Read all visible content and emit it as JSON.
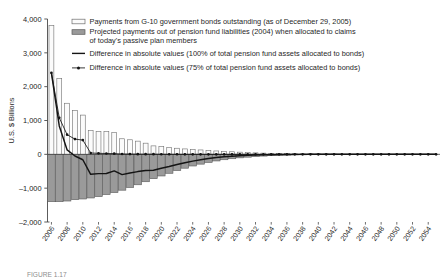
{
  "chart_data": {
    "type": "bar",
    "title": "",
    "subtitle": "",
    "xlabel": "",
    "ylabel": "U.S. $ Billions",
    "ylim": [
      -2000,
      4000
    ],
    "yticks": [
      4000,
      3000,
      2000,
      1000,
      0,
      -1000,
      -2000
    ],
    "ytick_labels": [
      "4,000",
      "3,000",
      "2,000",
      "1,000",
      "0",
      "–1,000",
      "–2,000"
    ],
    "grid": false,
    "legend_position": "upper-right-inside",
    "x": [
      2006,
      2007,
      2008,
      2009,
      2010,
      2011,
      2012,
      2013,
      2014,
      2015,
      2016,
      2017,
      2018,
      2019,
      2020,
      2021,
      2022,
      2023,
      2024,
      2025,
      2026,
      2027,
      2028,
      2029,
      2030,
      2031,
      2032,
      2033,
      2034,
      2035,
      2036,
      2037,
      2038,
      2039,
      2040,
      2041,
      2042,
      2043,
      2044,
      2045,
      2046,
      2047,
      2048,
      2049,
      2050,
      2051,
      2052,
      2053,
      2054,
      2055
    ],
    "xtick_labels": [
      "2006",
      "2008",
      "2010",
      "2012",
      "2014",
      "2016",
      "2018",
      "2020",
      "2022",
      "2024",
      "2026",
      "2028",
      "2030",
      "2032",
      "2034",
      "2036",
      "2038",
      "2040",
      "2042",
      "2044",
      "2046",
      "2048",
      "2050",
      "2052",
      "2054"
    ],
    "series": [
      {
        "name": "Payments from G-10 government bonds outstanding (as of December 29, 2005)",
        "key": "bonds_outstanding",
        "style": "bar-white",
        "values": [
          3810,
          2240,
          1510,
          1290,
          1160,
          700,
          680,
          670,
          640,
          460,
          430,
          390,
          330,
          250,
          230,
          200,
          180,
          160,
          145,
          130,
          115,
          100,
          88,
          76,
          64,
          54,
          44,
          36,
          30,
          25,
          20,
          17,
          14,
          12,
          10,
          9,
          8,
          7,
          6,
          5,
          5,
          4,
          4,
          3,
          3,
          3,
          2,
          2,
          2,
          2
        ]
      },
      {
        "name": "Projected payments out of pension fund liabilities (2004) when allocated to claims of today's passive plan members",
        "key": "pension_liabilities",
        "style": "bar-gray",
        "values": [
          -1400,
          -1400,
          -1380,
          -1340,
          -1320,
          -1290,
          -1250,
          -1190,
          -1130,
          -1060,
          -980,
          -900,
          -810,
          -720,
          -640,
          -560,
          -480,
          -410,
          -345,
          -290,
          -240,
          -196,
          -160,
          -130,
          -104,
          -84,
          -66,
          -52,
          -40,
          -31,
          -24,
          -19,
          -15,
          -12,
          -10,
          -8,
          -7,
          -6,
          -5,
          -4,
          -4,
          -3,
          -3,
          -2,
          -2,
          -2,
          -2,
          -1,
          -1,
          -1
        ]
      },
      {
        "name": "Difference in absolute values (100% of total pension fund assets allocated to bonds)",
        "key": "difference_100pct",
        "style": "line-solid",
        "values": [
          2410,
          840,
          130,
          -50,
          -160,
          -590,
          -570,
          -565,
          -490,
          -600,
          -550,
          -510,
          -480,
          -470,
          -410,
          -360,
          -300,
          -250,
          -200,
          -160,
          -125,
          -96,
          -72,
          -54,
          -40,
          -30,
          -22,
          -16,
          -10,
          -6,
          -4,
          -2,
          -1,
          0,
          0,
          0,
          0,
          0,
          0,
          0,
          0,
          0,
          0,
          0,
          0,
          0,
          0,
          0,
          0,
          0
        ]
      },
      {
        "name": "Difference in absolute values (75% of total pension fund assets allocated to bonds)",
        "key": "difference_75pct",
        "style": "line-marker",
        "values": [
          2410,
          1080,
          580,
          450,
          420,
          40,
          30,
          25,
          20,
          10,
          8,
          6,
          5,
          4,
          3,
          2,
          2,
          1,
          1,
          1,
          0,
          0,
          0,
          0,
          0,
          0,
          0,
          0,
          0,
          0,
          0,
          0,
          0,
          0,
          0,
          0,
          0,
          0,
          0,
          0,
          0,
          0,
          0,
          0,
          0,
          0,
          0,
          0,
          0,
          0
        ]
      }
    ]
  },
  "legend": {
    "items": [
      {
        "swatch": "bar-white",
        "label": "Payments from G-10 government bonds outstanding (as of December 29, 2005)"
      },
      {
        "swatch": "bar-gray",
        "label": "Projected payments out of pension fund liabilities (2004) when allocated to claims"
      },
      {
        "swatch": "none",
        "label": "of today's passive plan members"
      },
      {
        "swatch": "line-solid",
        "label": "Difference in absolute values (100% of total pension fund assets allocated to bonds)"
      },
      {
        "swatch": "line-marker",
        "label": "Difference in absolute values (75% of total pension fund assets allocated to bonds)"
      }
    ]
  },
  "colors": {
    "bar_white_fill": "#fbfbfb",
    "bar_white_stroke": "#6e6e6e",
    "bar_gray_fill": "#9a9a9a",
    "bar_gray_stroke": "#5a5a5a",
    "line": "#141414",
    "axis": "#4a4a4a",
    "text": "#262626"
  },
  "caption": {
    "text": "FIGURE 1.17"
  }
}
